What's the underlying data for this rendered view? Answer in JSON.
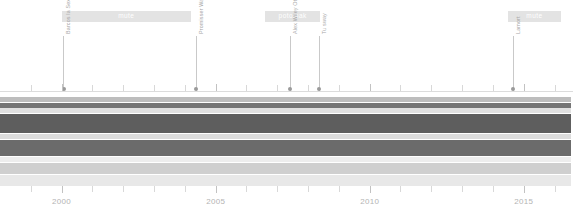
{
  "chart_data": {
    "type": "area",
    "title": "",
    "xlabel": "",
    "ylabel": "",
    "xlim": [
      1998,
      2016.6
    ],
    "grid": false,
    "legend_position": "none",
    "x_ticks": [
      2000,
      2005,
      2010,
      2015
    ],
    "x_tick_labels": [
      "2000",
      "2005",
      "2010",
      "2015"
    ],
    "minor_tick_years": [
      1999,
      2001,
      2002,
      2003,
      2004,
      2006,
      2007,
      2008,
      2009,
      2011,
      2012,
      2013,
      2014,
      2016
    ],
    "series": [
      {
        "name": "band-1",
        "color": "#bdbdbd",
        "y_top": 97,
        "y_bottom": 102,
        "x_start": 1998.0,
        "x_end": 2016.55
      },
      {
        "name": "band-2",
        "color": "#757575",
        "y_top": 103,
        "y_bottom": 108,
        "x_start": 1998.0,
        "x_end": 2016.55
      },
      {
        "name": "band-3",
        "color": "#e0e0e0",
        "y_top": 108,
        "y_bottom": 113,
        "x_start": 1998.0,
        "x_end": 2016.55
      },
      {
        "name": "band-4",
        "color": "#5e5e5e",
        "y_top": 114,
        "y_bottom": 133,
        "x_start": 1998.0,
        "x_end": 2016.55
      },
      {
        "name": "band-5",
        "color": "#dcdcdc",
        "y_top": 134,
        "y_bottom": 139,
        "x_start": 1998.0,
        "x_end": 2016.55
      },
      {
        "name": "band-6",
        "color": "#6b6b6b",
        "y_top": 140,
        "y_bottom": 156,
        "x_start": 1998.0,
        "x_end": 2016.55
      },
      {
        "name": "band-7",
        "color": "#ededed",
        "y_top": 157,
        "y_bottom": 162,
        "x_start": 1998.0,
        "x_end": 2016.55
      },
      {
        "name": "band-8",
        "color": "#cfcfcf",
        "y_top": 163,
        "y_bottom": 174,
        "x_start": 1998.0,
        "x_end": 2016.55
      },
      {
        "name": "band-9",
        "color": "#e8e8e8",
        "y_top": 175,
        "y_bottom": 186,
        "x_start": 1998.0,
        "x_end": 2016.55
      }
    ],
    "eras": [
      {
        "label": "mute",
        "x_start": 2000.0,
        "x_end": 2004.2
      },
      {
        "label": "potomak",
        "x_start": 2006.6,
        "x_end": 2008.4
      },
      {
        "label": "mute",
        "x_start": 2014.5,
        "x_end": 2016.2
      }
    ],
    "annotations": [
      {
        "label": "Barcos la Sexy",
        "year": 2000.05
      },
      {
        "label": "Promisser Wahle",
        "year": 2004.35
      },
      {
        "label": "Alex Wiley Otto",
        "year": 2007.4
      },
      {
        "label": "Tu sway",
        "year": 2008.35
      },
      {
        "label": "Lamort",
        "year": 2014.65
      }
    ]
  },
  "colors": {
    "background": "#ffffff",
    "era_band": "#e3e3e3",
    "era_text": "#ffffff",
    "annotation_text": "#a8a8a8",
    "annotation_line": "#c9c9c9",
    "annotation_dot": "#9a9a9a",
    "axis_line": "#dcdcdc",
    "tick": "#d8d8d8",
    "axis_label": "#b4b4b4"
  }
}
